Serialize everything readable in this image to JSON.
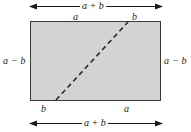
{
  "figure": {
    "colors": {
      "fill": "#d3d3d3",
      "stroke": "#3a3a3a",
      "text": "#1a1a1a",
      "background": "#ffffff"
    }
  },
  "labels": {
    "top_total": "a + b",
    "top_left_segment": "a",
    "top_right_segment": "b",
    "left_side": "a − b",
    "right_side": "a − b",
    "bottom_left_segment": "b",
    "bottom_right_segment": "a",
    "bottom_total": "a + b"
  },
  "geometry": {
    "rect_width_label": "a + b",
    "rect_height_label": "a − b",
    "diagonal_style": "dashed"
  }
}
